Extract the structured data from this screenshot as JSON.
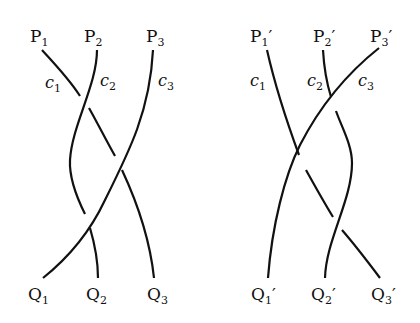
{
  "diagrams": [
    {
      "name": "left-braid",
      "top_labels": [
        {
          "base": "P",
          "sub": "1",
          "prime": ""
        },
        {
          "base": "P",
          "sub": "2",
          "prime": ""
        },
        {
          "base": "P",
          "sub": "3",
          "prime": ""
        }
      ],
      "curve_labels": [
        {
          "base": "c",
          "sub": "1"
        },
        {
          "base": "c",
          "sub": "2"
        },
        {
          "base": "c",
          "sub": "3"
        }
      ],
      "bottom_labels": [
        {
          "base": "Q",
          "sub": "1",
          "prime": ""
        },
        {
          "base": "Q",
          "sub": "2",
          "prime": ""
        },
        {
          "base": "Q",
          "sub": "3",
          "prime": ""
        }
      ]
    },
    {
      "name": "right-braid",
      "top_labels": [
        {
          "base": "P",
          "sub": "1",
          "prime": "′"
        },
        {
          "base": "P",
          "sub": "2",
          "prime": "′"
        },
        {
          "base": "P",
          "sub": "3",
          "prime": "′"
        }
      ],
      "curve_labels": [
        {
          "base": "c",
          "sub": "1"
        },
        {
          "base": "c",
          "sub": "2"
        },
        {
          "base": "c",
          "sub": "3"
        }
      ],
      "bottom_labels": [
        {
          "base": "Q",
          "sub": "1",
          "prime": "′"
        },
        {
          "base": "Q",
          "sub": "2",
          "prime": "′"
        },
        {
          "base": "Q",
          "sub": "3",
          "prime": "′"
        }
      ]
    }
  ],
  "colors": {
    "stroke": "#111111",
    "background": "#ffffff"
  }
}
